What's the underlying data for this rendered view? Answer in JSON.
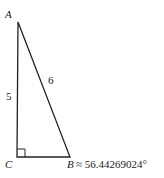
{
  "diagram": {
    "type": "right-triangle",
    "vertices": {
      "A": {
        "label": "A"
      },
      "B": {
        "label": "B"
      },
      "C": {
        "label": "C"
      }
    },
    "sides": {
      "AC": "5",
      "AB": "6"
    },
    "right_angle_at": "C",
    "angle_B": "≈ 56.44269024°"
  }
}
